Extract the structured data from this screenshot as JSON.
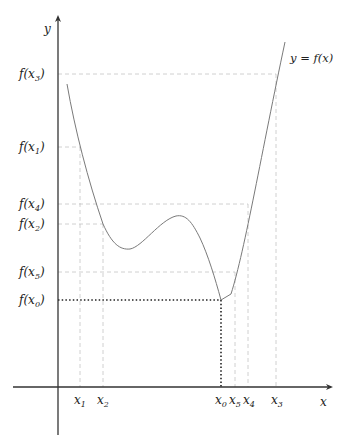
{
  "diagram": {
    "axes": {
      "x_label": "x",
      "y_label": "y",
      "color": "#333333"
    },
    "curve_label": "y = f(x)",
    "curve_color": "#777777",
    "guide_color": "#bbbbbb",
    "highlight_color": "#222222",
    "x_ticks": [
      {
        "base": "x",
        "sub": "1",
        "px": 80
      },
      {
        "base": "x",
        "sub": "2",
        "px": 103
      },
      {
        "base": "x",
        "sub": "0",
        "px": 221
      },
      {
        "base": "x",
        "sub": "5",
        "px": 235
      },
      {
        "base": "x",
        "sub": "4",
        "px": 248
      },
      {
        "base": "x",
        "sub": "3",
        "px": 276
      }
    ],
    "y_ticks": [
      {
        "text": "f(x",
        "sub": "3",
        "close": ")",
        "py": 74
      },
      {
        "text": "f(x",
        "sub": "1",
        "close": ")",
        "py": 147
      },
      {
        "text": "f(x",
        "sub": "4",
        "close": ")",
        "py": 204
      },
      {
        "text": "f(x",
        "sub": "2",
        "close": ")",
        "py": 224
      },
      {
        "text": "f(x",
        "sub": "5",
        "close": ")",
        "py": 272
      },
      {
        "text": "f(x",
        "sub": "0",
        "close": ")",
        "py": 300
      }
    ],
    "highlighted_point": "x0"
  }
}
